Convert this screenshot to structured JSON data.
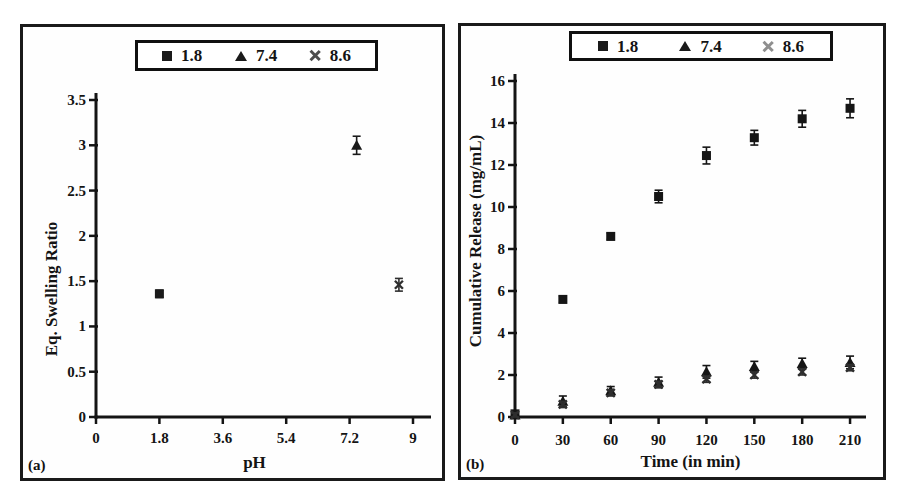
{
  "figure": {
    "panels": [
      {
        "label": "(a)"
      },
      {
        "label": "(b)"
      }
    ]
  },
  "chart_data": [
    {
      "type": "scatter",
      "panel_label": "(a)",
      "title": "",
      "xlabel": "pH",
      "ylabel": "Eq. Swelling Ratio",
      "xlim": [
        0,
        9
      ],
      "ylim": [
        0,
        3.5
      ],
      "xticks": [
        0,
        1.8,
        3.6,
        5.4,
        7.2,
        9
      ],
      "yticks": [
        0,
        0.5,
        1,
        1.5,
        2,
        2.5,
        3,
        3.5
      ],
      "grid": false,
      "legend_position": "top",
      "legend": [
        {
          "label": "1.8",
          "marker": "square",
          "color": "#1a1a1a"
        },
        {
          "label": "7.4",
          "marker": "triangle",
          "color": "#1a1a1a"
        },
        {
          "label": "8.6",
          "marker": "x",
          "color": "#4d4d4d"
        }
      ],
      "series": [
        {
          "name": "1.8",
          "marker": "square",
          "color": "#1a1a1a",
          "points": [
            {
              "x": 1.8,
              "y": 1.36,
              "err": 0.04
            }
          ]
        },
        {
          "name": "7.4",
          "marker": "triangle",
          "color": "#1a1a1a",
          "points": [
            {
              "x": 7.4,
              "y": 3.0,
              "err": 0.1
            }
          ]
        },
        {
          "name": "8.6",
          "marker": "x",
          "color": "#2e2e2e",
          "points": [
            {
              "x": 8.6,
              "y": 1.46,
              "err": 0.07
            }
          ]
        }
      ]
    },
    {
      "type": "scatter",
      "panel_label": "(b)",
      "title": "",
      "xlabel": "Time (in min)",
      "ylabel": "Cumulative Release (mg/mL)",
      "xlim": [
        0,
        220
      ],
      "ylim": [
        0,
        16
      ],
      "xticks": [
        0,
        30,
        60,
        90,
        120,
        150,
        180,
        210
      ],
      "yticks": [
        0,
        2,
        4,
        6,
        8,
        10,
        12,
        14,
        16
      ],
      "grid": false,
      "legend_position": "top",
      "legend": [
        {
          "label": "1.8",
          "marker": "square",
          "color": "#1a1a1a"
        },
        {
          "label": "7.4",
          "marker": "triangle",
          "color": "#1a1a1a"
        },
        {
          "label": "8.6",
          "marker": "x",
          "color": "#8f8f8f"
        }
      ],
      "series": [
        {
          "name": "1.8",
          "marker": "square",
          "color": "#151515",
          "points": [
            {
              "x": 0,
              "y": 0.15,
              "err": 0.1
            },
            {
              "x": 30,
              "y": 5.6,
              "err": 0.15
            },
            {
              "x": 60,
              "y": 8.6,
              "err": 0.15
            },
            {
              "x": 90,
              "y": 10.5,
              "err": 0.3
            },
            {
              "x": 120,
              "y": 12.45,
              "err": 0.4
            },
            {
              "x": 150,
              "y": 13.3,
              "err": 0.35
            },
            {
              "x": 180,
              "y": 14.2,
              "err": 0.4
            },
            {
              "x": 210,
              "y": 14.7,
              "err": 0.45
            }
          ]
        },
        {
          "name": "7.4",
          "marker": "triangle",
          "color": "#151515",
          "points": [
            {
              "x": 0,
              "y": 0.1,
              "err": 0.1
            },
            {
              "x": 30,
              "y": 0.75,
              "err": 0.25
            },
            {
              "x": 60,
              "y": 1.25,
              "err": 0.2
            },
            {
              "x": 90,
              "y": 1.65,
              "err": 0.25
            },
            {
              "x": 120,
              "y": 2.15,
              "err": 0.3
            },
            {
              "x": 150,
              "y": 2.4,
              "err": 0.25
            },
            {
              "x": 180,
              "y": 2.55,
              "err": 0.25
            },
            {
              "x": 210,
              "y": 2.6,
              "err": 0.3
            }
          ]
        },
        {
          "name": "8.6",
          "marker": "x",
          "color": "#2e2e2e",
          "points": [
            {
              "x": 0,
              "y": 0.1,
              "err": 0.1
            },
            {
              "x": 30,
              "y": 0.6,
              "err": 0.15
            },
            {
              "x": 60,
              "y": 1.15,
              "err": 0.15
            },
            {
              "x": 90,
              "y": 1.55,
              "err": 0.15
            },
            {
              "x": 120,
              "y": 1.8,
              "err": 0.15
            },
            {
              "x": 150,
              "y": 2.0,
              "err": 0.15
            },
            {
              "x": 180,
              "y": 2.15,
              "err": 0.15
            },
            {
              "x": 210,
              "y": 2.35,
              "err": 0.15
            }
          ]
        }
      ]
    }
  ]
}
